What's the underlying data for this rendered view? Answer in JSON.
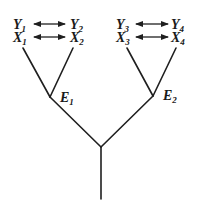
{
  "diagram": {
    "type": "tree",
    "left_group": {
      "top_pair": {
        "left": "Y",
        "left_sub": "1",
        "right": "Y",
        "right_sub": "2"
      },
      "bottom_pair": {
        "left": "X",
        "left_sub": "1",
        "right": "X",
        "right_sub": "2"
      },
      "node_label": "E",
      "node_sub": "1"
    },
    "right_group": {
      "top_pair": {
        "left": "Y",
        "left_sub": "3",
        "right": "Y",
        "right_sub": "4"
      },
      "bottom_pair": {
        "left": "X",
        "left_sub": "3",
        "right": "X",
        "right_sub": "4"
      },
      "node_label": "E",
      "node_sub": "2"
    },
    "relations": [
      "Y1 ↔ Y2",
      "X1 ↔ X2",
      "Y3 ↔ Y4",
      "X3 ↔ X4"
    ],
    "edges": [
      [
        "X1",
        "E1"
      ],
      [
        "X2",
        "E1"
      ],
      [
        "X3",
        "E2"
      ],
      [
        "X4",
        "E2"
      ],
      [
        "E1",
        "root"
      ],
      [
        "E2",
        "root"
      ]
    ],
    "colors": {
      "ink": "#1f1f1f",
      "background": "#ffffff"
    }
  }
}
